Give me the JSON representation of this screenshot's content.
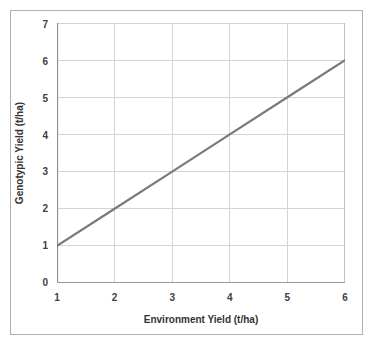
{
  "chart_data": {
    "type": "line",
    "title": "",
    "xlabel": "Environment Yield (t/ha)",
    "ylabel": "Genotypic Yield (t/ha)",
    "xlim": [
      1,
      6
    ],
    "ylim": [
      0,
      7
    ],
    "xticks": [
      "1",
      "2",
      "3",
      "4",
      "5",
      "6"
    ],
    "yticks": [
      "0",
      "1",
      "2",
      "3",
      "4",
      "5",
      "6",
      "7"
    ],
    "grid": true,
    "legend": "none",
    "series": [
      {
        "name": "Genotypic response",
        "color": "#7a7a7a",
        "x": [
          1,
          2,
          3,
          4,
          5,
          6
        ],
        "values": [
          1,
          2,
          3,
          4,
          5,
          6
        ]
      }
    ]
  },
  "axes": {
    "x_title": "Environment Yield (t/ha)",
    "y_title": "Genotypic Yield (t/ha)",
    "x_tick_labels": [
      "1",
      "2",
      "3",
      "4",
      "5",
      "6"
    ],
    "y_tick_labels": [
      "0",
      "1",
      "2",
      "3",
      "4",
      "5",
      "6",
      "7"
    ]
  },
  "style": {
    "line_color": "#7a7a7a",
    "grid_color": "#d4d4d4",
    "axis_color": "#9a9a9a",
    "frame_color": "#b0b0b0",
    "text_color": "#333333",
    "background": "#ffffff"
  }
}
